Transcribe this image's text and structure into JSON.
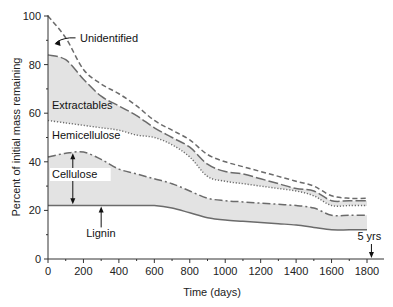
{
  "chart_data": {
    "type": "area",
    "title": "",
    "xlabel": "Time (days)",
    "ylabel": "Percent of initial mass remaining",
    "xlim": [
      0,
      1850
    ],
    "ylim": [
      0,
      100
    ],
    "x_ticks": [
      0,
      200,
      400,
      600,
      800,
      1000,
      1200,
      1400,
      1600,
      1800
    ],
    "y_ticks": [
      0,
      20,
      40,
      60,
      80,
      100
    ],
    "grid": false,
    "legend": "none (inline annotations)",
    "series": [
      {
        "name": "Unidentified",
        "style": "short-dashed",
        "x": [
          0,
          100,
          200,
          300,
          400,
          500,
          600,
          700,
          800,
          900,
          1000,
          1100,
          1200,
          1300,
          1400,
          1500,
          1600,
          1700,
          1800
        ],
        "values": [
          100,
          91,
          78,
          72,
          68,
          63,
          57,
          53,
          49,
          43,
          40,
          38,
          36,
          34,
          32,
          30,
          26,
          25,
          25
        ]
      },
      {
        "name": "Extractables",
        "style": "long-dashed",
        "x": [
          0,
          100,
          200,
          300,
          400,
          500,
          600,
          700,
          800,
          900,
          1000,
          1100,
          1200,
          1300,
          1400,
          1500,
          1600,
          1700,
          1800
        ],
        "values": [
          84,
          82,
          74,
          67,
          63,
          59,
          54,
          50,
          46,
          39,
          36,
          35,
          33,
          31,
          29,
          28,
          24,
          24,
          24
        ]
      },
      {
        "name": "Hemicellulose",
        "style": "dotted",
        "x": [
          0,
          100,
          200,
          300,
          400,
          500,
          600,
          700,
          800,
          900,
          1000,
          1100,
          1200,
          1300,
          1400,
          1500,
          1600,
          1700,
          1800
        ],
        "values": [
          57,
          56,
          55,
          54,
          53,
          51,
          50,
          47,
          42,
          34,
          32,
          31,
          30,
          29,
          28,
          26,
          22,
          22,
          22
        ]
      },
      {
        "name": "Cellulose",
        "style": "dash-dot",
        "x": [
          0,
          100,
          200,
          300,
          400,
          500,
          600,
          700,
          800,
          900,
          1000,
          1100,
          1200,
          1300,
          1400,
          1500,
          1600,
          1700,
          1800
        ],
        "values": [
          42,
          43.5,
          44,
          41,
          37,
          35,
          33,
          31,
          28,
          25,
          24,
          23.5,
          23,
          22.5,
          22,
          21,
          18,
          18,
          18
        ]
      },
      {
        "name": "Lignin",
        "style": "solid",
        "x": [
          0,
          100,
          200,
          300,
          400,
          500,
          600,
          700,
          800,
          900,
          1000,
          1100,
          1200,
          1300,
          1400,
          1500,
          1600,
          1700,
          1800
        ],
        "values": [
          22,
          22,
          22,
          22,
          22,
          22,
          22,
          21,
          19,
          17,
          16,
          15.5,
          15,
          14.5,
          14,
          13,
          12,
          12,
          12
        ]
      }
    ],
    "shaded_bands": [
      "Extractables (between Extractables and Hemicellulose lines)",
      "Cellulose (between Cellulose and Lignin lines)"
    ],
    "annotations": [
      {
        "text": "Unidentified",
        "arrow_to": [
          20,
          90
        ]
      },
      {
        "text": "Extractables",
        "at": [
          30,
          64
        ]
      },
      {
        "text": "Hemicellulose",
        "at": [
          30,
          50
        ]
      },
      {
        "text": "Cellulose",
        "at": [
          30,
          38
        ],
        "double_arrow": [
          22,
          44
        ]
      },
      {
        "text": "Lignin",
        "at": [
          300,
          10
        ],
        "arrow_to": [
          300,
          22
        ]
      },
      {
        "text": "5 yrs",
        "arrow_to": [
          1825,
          0
        ]
      }
    ]
  }
}
